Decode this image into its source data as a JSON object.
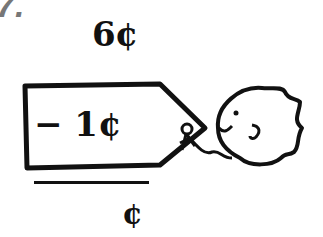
{
  "problem": {
    "number": "7.",
    "minuend": "6¢",
    "subtrahend": "− 1¢",
    "answer_unit": "¢",
    "answer_value": ""
  },
  "illustration": {
    "tag": "price-tag",
    "character": "fish"
  },
  "colors": {
    "ink": "#111111",
    "number": "#777777",
    "background": "#ffffff"
  }
}
